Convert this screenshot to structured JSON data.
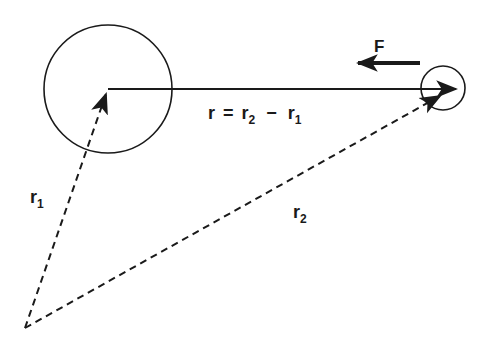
{
  "diagram": {
    "type": "vector-diagram",
    "colors": {
      "stroke": "#1a1a1a",
      "background": "#ffffff"
    },
    "bodies": [
      {
        "id": "body-1",
        "shape": "circle",
        "cx": 108,
        "cy": 89,
        "r": 64
      },
      {
        "id": "body-2",
        "shape": "circle",
        "cx": 443,
        "cy": 88,
        "r": 22
      }
    ],
    "origin": {
      "x": 25,
      "y": 328
    },
    "vectors": [
      {
        "id": "r1",
        "label": "r",
        "subscript": "1",
        "style": "dashed",
        "from": "origin",
        "to": "body-1 center"
      },
      {
        "id": "r2",
        "label": "r",
        "subscript": "2",
        "style": "dashed",
        "from": "origin",
        "to": "body-2 center"
      },
      {
        "id": "r",
        "label": "r",
        "style": "solid",
        "from": "body-1 center",
        "to": "body-2 center"
      },
      {
        "id": "F",
        "label": "F",
        "style": "solid-thick",
        "direction": "left",
        "acts_on": "body-2"
      }
    ],
    "labels": {
      "force": "F",
      "relation": {
        "lhs": "r",
        "eq": "=",
        "t1": "r",
        "t1_sub": "2",
        "minus": "−",
        "t2": "r",
        "t2_sub": "1"
      },
      "r1": {
        "base": "r",
        "sub": "1"
      },
      "r2": {
        "base": "r",
        "sub": "2"
      }
    }
  }
}
